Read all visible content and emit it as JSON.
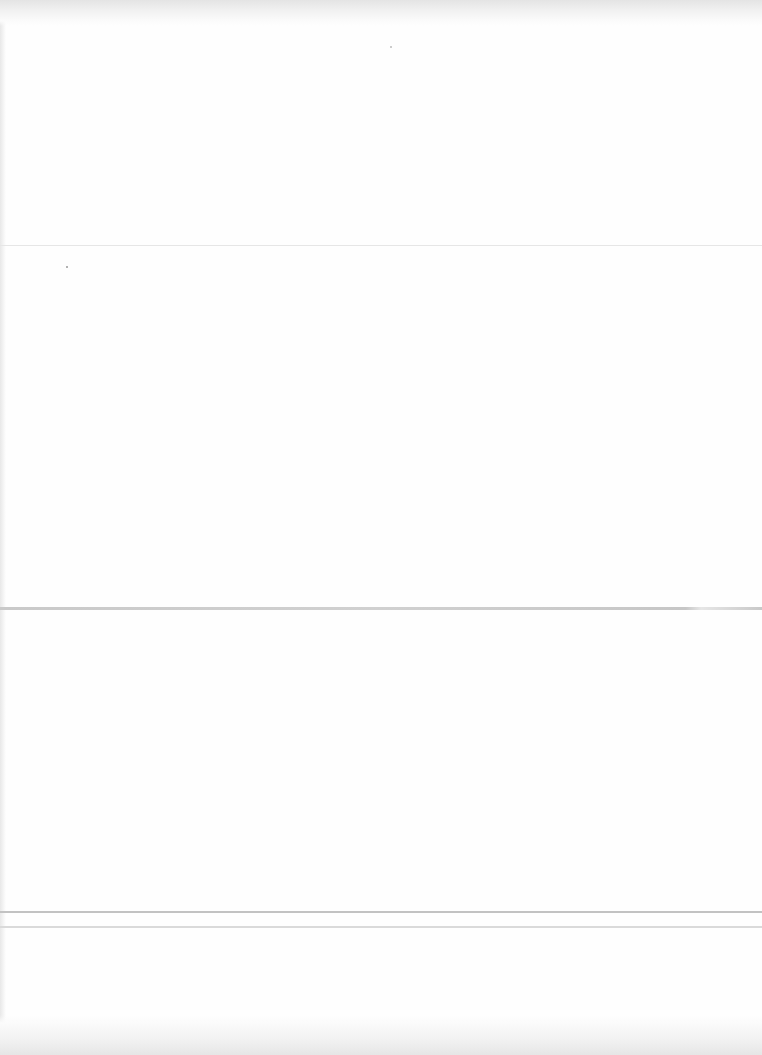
{
  "document": {
    "type": "scanned-page",
    "background": "#fefefe",
    "top_band_text": "",
    "bottom_band_text": "",
    "rules": [
      {
        "y": 245,
        "color": "#e6e6e6"
      },
      {
        "y": 607,
        "color": "#c9c9c9"
      },
      {
        "y": 911,
        "color": "#c2c2c2"
      },
      {
        "y": 926,
        "color": "#dadada"
      }
    ]
  }
}
